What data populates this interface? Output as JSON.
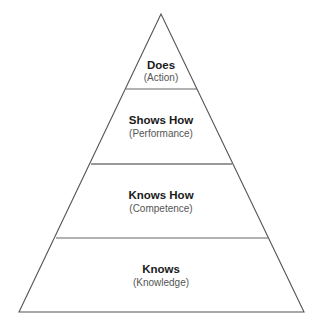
{
  "diagram": {
    "type": "pyramid",
    "colors": {
      "background": "#ffffff",
      "outline": "#555555",
      "divider": "#777777",
      "title": "#1a1a1a",
      "subtitle": "#555555"
    },
    "levels": [
      {
        "title": "Does",
        "subtitle": "(Action)"
      },
      {
        "title": "Shows How",
        "subtitle": "(Performance)"
      },
      {
        "title": "Knows How",
        "subtitle": "(Competence)"
      },
      {
        "title": "Knows",
        "subtitle": "(Knowledge)"
      }
    ]
  }
}
